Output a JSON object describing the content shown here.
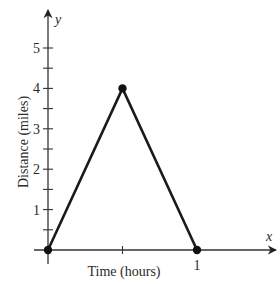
{
  "chart_data": {
    "type": "line",
    "title": "",
    "xlabel": "Time (hours)",
    "ylabel": "Distance (miles)",
    "x_axis_var": "x",
    "y_axis_var": "y",
    "xlim": [
      0,
      1.3
    ],
    "ylim": [
      0,
      5.5
    ],
    "x_ticks": [
      0.5,
      1
    ],
    "x_tick_labels": [
      "",
      "1"
    ],
    "y_ticks": [
      0.5,
      1,
      1.5,
      2,
      2.5,
      3,
      3.5,
      4,
      4.5,
      5
    ],
    "y_tick_labels": [
      "",
      "1",
      "",
      "2",
      "",
      "3",
      "",
      "4",
      "",
      "5"
    ],
    "grid": false,
    "legend": null,
    "series": [
      {
        "name": "distance",
        "x": [
          0,
          0.5,
          1
        ],
        "y": [
          0,
          4,
          0
        ],
        "markers": true,
        "color": "#1a1a1a"
      }
    ]
  }
}
